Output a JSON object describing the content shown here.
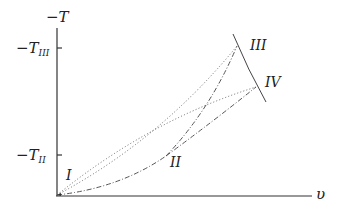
{
  "diagram": {
    "axes": {
      "y_label": "−T",
      "x_label": "υ",
      "y_ticks": [
        {
          "label_main": "−T",
          "label_sub": "III",
          "y": 48
        },
        {
          "label_main": "−T",
          "label_sub": "II",
          "y": 155
        }
      ]
    },
    "points": [
      {
        "label": "I",
        "x": 57,
        "y": 195
      },
      {
        "label": "II",
        "x": 166,
        "y": 156
      },
      {
        "label": "III",
        "x": 237,
        "y": 46
      },
      {
        "label": "IV",
        "x": 256,
        "y": 87
      }
    ],
    "point_labels": {
      "I": "I",
      "II": "II",
      "III": "III",
      "IV": "IV"
    },
    "curves": [
      {
        "name": "boundary",
        "style": "solid",
        "from": "above-III",
        "to": "below-IV"
      },
      {
        "name": "I-III",
        "style": "dotted"
      },
      {
        "name": "I-IV",
        "style": "dotted"
      },
      {
        "name": "I-II",
        "style": "dash-dot"
      },
      {
        "name": "II-III",
        "style": "dash-dot"
      },
      {
        "name": "II-IV",
        "style": "dash-dot"
      }
    ]
  }
}
